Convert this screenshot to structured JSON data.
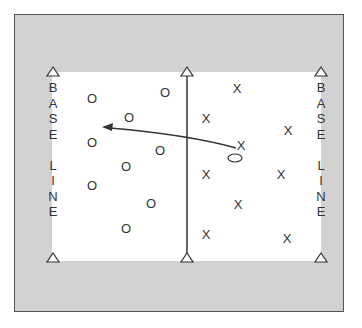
{
  "diagram": {
    "left_label": [
      "B",
      "A",
      "S",
      "E",
      "",
      "L",
      "I",
      "N",
      "E"
    ],
    "right_label": [
      "B",
      "A",
      "S",
      "E",
      "",
      "L",
      "I",
      "N",
      "E"
    ],
    "team_o": {
      "symbol": "O",
      "players": [
        {
          "x": 92,
          "y": 98
        },
        {
          "x": 165,
          "y": 92
        },
        {
          "x": 129,
          "y": 117
        },
        {
          "x": 92,
          "y": 142
        },
        {
          "x": 160,
          "y": 150
        },
        {
          "x": 126,
          "y": 166
        },
        {
          "x": 92,
          "y": 185
        },
        {
          "x": 151,
          "y": 203
        },
        {
          "x": 126,
          "y": 228
        }
      ]
    },
    "team_x": {
      "symbol": "X",
      "players": [
        {
          "x": 237,
          "y": 88
        },
        {
          "x": 206,
          "y": 118
        },
        {
          "x": 288,
          "y": 130
        },
        {
          "x": 241,
          "y": 145
        },
        {
          "x": 206,
          "y": 174
        },
        {
          "x": 281,
          "y": 174
        },
        {
          "x": 238,
          "y": 204
        },
        {
          "x": 206,
          "y": 234
        },
        {
          "x": 287,
          "y": 238
        }
      ]
    },
    "ball": {
      "x": 235,
      "y": 158
    },
    "colors": {
      "background": "#d2d2d2",
      "court": "#ffffff",
      "ink": "#333333"
    }
  }
}
